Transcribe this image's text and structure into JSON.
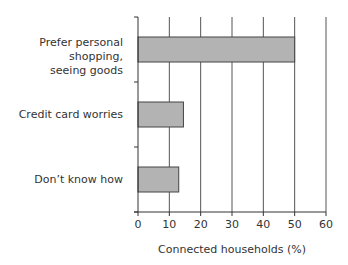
{
  "chart_data": {
    "type": "bar",
    "orientation": "horizontal",
    "title": "",
    "categories": [
      "Prefer personal shopping, seeing goods",
      "Credit card worries",
      "Don’t know how"
    ],
    "category_lines": [
      [
        "Prefer personal shopping,",
        "seeing goods"
      ],
      [
        "Credit card worries"
      ],
      [
        "Don’t know how"
      ]
    ],
    "values": [
      50,
      14.5,
      13
    ],
    "xlabel": "Connected households (%)",
    "ylabel": "",
    "xlim": [
      0,
      60
    ],
    "xticks": [
      0,
      10,
      20,
      30,
      40,
      50,
      60
    ],
    "grid": true,
    "legend": null,
    "bar_color": "#b3b3b3",
    "bar_edge_color": "#444444",
    "grid_color": "#555555"
  }
}
